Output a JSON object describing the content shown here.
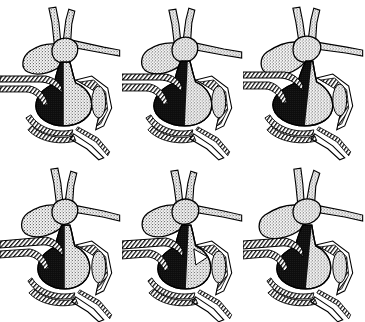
{
  "figure": {
    "background_color": "#ffffff",
    "ink_color": "#000000",
    "stipple_color": "#9a9a9a",
    "dense_fill_color": "#111111",
    "width_px": 365,
    "height_px": 322,
    "rows": 2,
    "columns": 3,
    "panel_count": 6,
    "has_visible_text": false,
    "caption_text": ""
  },
  "legend": {
    "fills": [
      {
        "key": "solid-black",
        "label": "Deoxygenated / dense fill",
        "color": "#111111"
      },
      {
        "key": "stipple-gray",
        "label": "Oxygenated / stippled fill",
        "color": "#9a9a9a"
      },
      {
        "key": "hatch",
        "label": "Vessel wall / myocardium hatching",
        "color": "#000000"
      },
      {
        "key": "open-white",
        "label": "Lumen / open space",
        "color": "#ffffff"
      }
    ]
  },
  "panels": [
    {
      "id": "panel-1",
      "position": "row-1-col-1",
      "row": 1,
      "column": 1,
      "label": "",
      "dark_fraction": 0.52,
      "stipple_fraction": 0.48,
      "notes": "Lower chamber split roughly in half: dark left, stippled right."
    },
    {
      "id": "panel-2",
      "position": "row-1-col-2",
      "row": 1,
      "column": 2,
      "label": "",
      "dark_fraction": 0.58,
      "stipple_fraction": 0.42,
      "notes": "Dark region slightly enlarged compared with panel 1."
    },
    {
      "id": "panel-3",
      "position": "row-1-col-3",
      "row": 1,
      "column": 3,
      "label": "",
      "dark_fraction": 0.64,
      "stipple_fraction": 0.36,
      "notes": "Dark region extends further right; upper vessel more steeply angled."
    },
    {
      "id": "panel-4",
      "position": "row-2-col-1",
      "row": 2,
      "column": 1,
      "label": "",
      "dark_fraction": 0.5,
      "stipple_fraction": 0.5,
      "notes": "Lower chamber narrower; hatched shelf above chamber more prominent."
    },
    {
      "id": "panel-5",
      "position": "row-2-col-2",
      "row": 2,
      "column": 2,
      "label": "",
      "dark_fraction": 0.56,
      "stipple_fraction": 0.44,
      "notes": "Dark chamber tilted; open triangular lumen at right."
    },
    {
      "id": "panel-6",
      "position": "row-2-col-3",
      "row": 2,
      "column": 3,
      "label": "",
      "dark_fraction": 0.62,
      "stipple_fraction": 0.38,
      "notes": "Dark chamber dominant; stippled band reduced to a right-hand sliver."
    }
  ],
  "structures": [
    {
      "key": "superior-vessel",
      "label": "Superior ascending vessel"
    },
    {
      "key": "upper-left-chamber",
      "label": "Upper left stippled chamber"
    },
    {
      "key": "upper-right-chamber",
      "label": "Upper right stippled chamber"
    },
    {
      "key": "lateral-branch",
      "label": "Lateral branching vessel"
    },
    {
      "key": "main-ventricle",
      "label": "Main lower chamber"
    },
    {
      "key": "hatched-wall",
      "label": "Hatched vessel wall"
    },
    {
      "key": "right-oval-lumen",
      "label": "Right oval lumen structure"
    },
    {
      "key": "lower-conduit",
      "label": "Lower horizontal conduit"
    }
  ]
}
